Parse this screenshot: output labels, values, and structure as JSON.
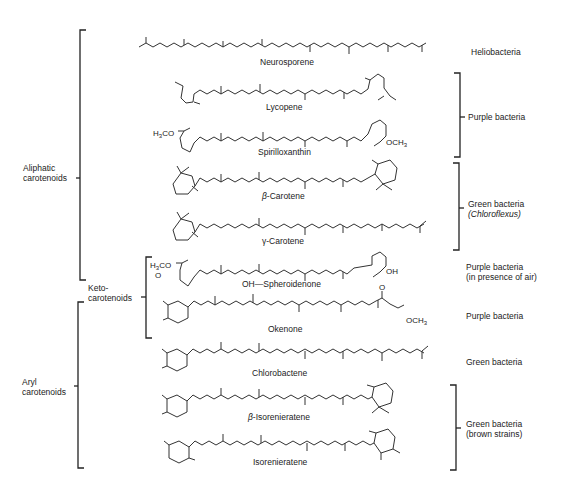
{
  "figure": {
    "groups_left": [
      {
        "id": "aliphatic",
        "label_line1": "Aliphatic",
        "label_line2": "carotenoids"
      },
      {
        "id": "keto",
        "label_line1": "Keto-",
        "label_line2": "carotenoids"
      },
      {
        "id": "aryl",
        "label_line1": "Aryl",
        "label_line2": "carotenoids"
      }
    ],
    "compounds": [
      {
        "name": "Neurosporene",
        "organism": "Heliobacteria"
      },
      {
        "name": "Lycopene",
        "organism": "Purple bacteria"
      },
      {
        "name": "Spirilloxanthin",
        "organism": "Purple bacteria"
      },
      {
        "name": "β-Carotene",
        "prefix": "β",
        "suffix": "-Carotene",
        "organism": "Green bacteria (Chloroflexus)"
      },
      {
        "name": "γ-Carotene",
        "prefix": "γ",
        "suffix": "-Carotene",
        "organism": "Green bacteria (Chloroflexus)"
      },
      {
        "name": "OH—Spheroidenone",
        "organism": "Purple bacteria (in presence of air)"
      },
      {
        "name": "Okenone",
        "organism": "Purple bacteria"
      },
      {
        "name": "Chlorobactene",
        "organism": "Green bacteria"
      },
      {
        "name": "β-Isorenieratene",
        "prefix": "β",
        "suffix": "-Isorenieratene",
        "organism": "Green bacteria (brown strains)"
      },
      {
        "name": "Isorenieratene",
        "organism": "Green bacteria (brown strains)"
      }
    ],
    "organism_labels": [
      {
        "id": "heliobacteria",
        "line1": "Heliobacteria"
      },
      {
        "id": "purple-bracket",
        "line1": "Purple bacteria"
      },
      {
        "id": "green-chloroflexus",
        "line1": "Green bacteria",
        "line2": "(Chloroflexus)"
      },
      {
        "id": "purple-air",
        "line1": "Purple bacteria",
        "line2": "(in presence of air)"
      },
      {
        "id": "purple-okenone",
        "line1": "Purple bacteria"
      },
      {
        "id": "green-chlorobactene",
        "line1": "Green bacteria"
      },
      {
        "id": "green-brown",
        "line1": "Green bacteria",
        "line2": "(brown strains)"
      }
    ],
    "substituents": {
      "h3co": "H₃CO",
      "och3": "OCH₃",
      "oh": "OH",
      "o": "O"
    }
  }
}
